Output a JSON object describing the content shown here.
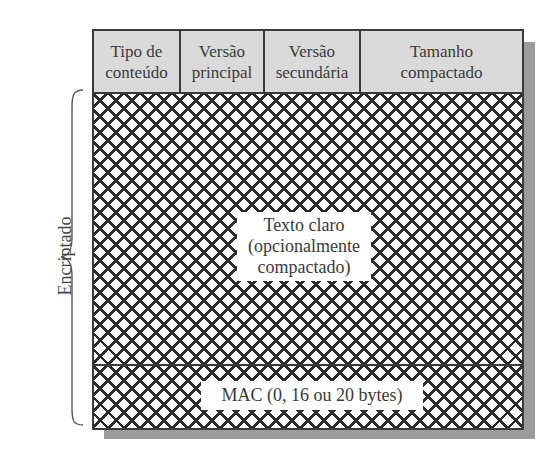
{
  "diagram": {
    "header_fields": [
      {
        "label": "Tipo de conteúdo",
        "line1": "Tipo de",
        "line2": "conteúdo",
        "width": 87
      },
      {
        "label": "Versão principal",
        "line1": "Versão",
        "line2": "principal",
        "width": 84
      },
      {
        "label": "Versão secundária",
        "line1": "Versão",
        "line2": "secundária",
        "width": 96
      },
      {
        "label": "Tamanho compactado",
        "line1": "Tamanho",
        "line2": "compactado",
        "width": 161
      }
    ],
    "body": {
      "line1": "Texto claro",
      "line2": "(opcionalmente",
      "line3": "compactado)"
    },
    "mac": {
      "label": "MAC (0, 16 ou 20 bytes)"
    },
    "brace_label": "Encriptado",
    "colors": {
      "header_fill": "#dadada",
      "border": "#3a3a3a",
      "hatch": "#2b2b2b",
      "shadow": "#9c9c9c"
    }
  }
}
